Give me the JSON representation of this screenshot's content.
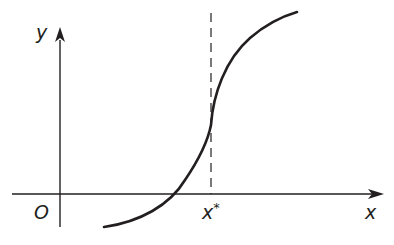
{
  "diagram": {
    "type": "function-graph",
    "labels": {
      "y_axis": "y",
      "x_axis": "x",
      "origin": "O",
      "x_star": "x",
      "x_star_sup": "*"
    },
    "colors": {
      "stroke": "#231f20",
      "background": "#ffffff"
    },
    "elements": [
      "x-axis with arrow",
      "y-axis with arrow",
      "vertical dashed line at x*",
      "curve concave up left of x*, concave down right of x*"
    ]
  }
}
